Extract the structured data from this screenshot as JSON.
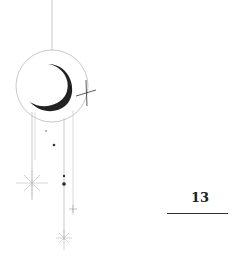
{
  "page": {
    "number": "13",
    "illustration": "crescent-moon-with-hanging-stars"
  },
  "colors": {
    "ink": "#222222",
    "line": "#b8b8b8"
  }
}
